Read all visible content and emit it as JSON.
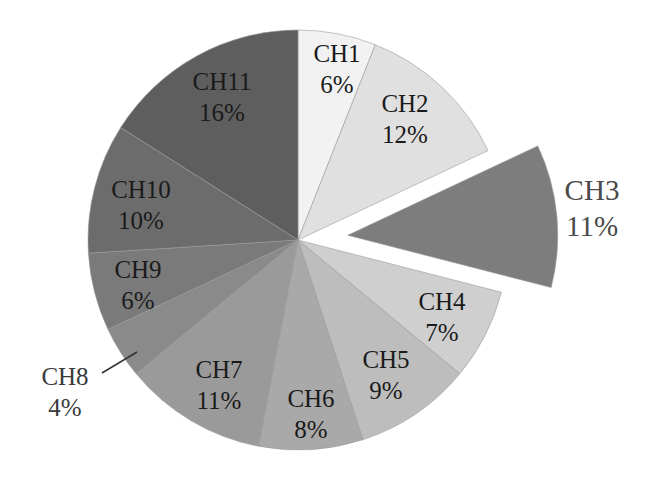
{
  "chart_data": {
    "type": "pie",
    "title": "",
    "categories": [
      "CH1",
      "CH2",
      "CH3",
      "CH4",
      "CH5",
      "CH6",
      "CH7",
      "CH8",
      "CH9",
      "CH10",
      "CH11"
    ],
    "values": [
      6,
      12,
      11,
      7,
      9,
      8,
      11,
      4,
      6,
      10,
      16
    ],
    "unit": "%",
    "labels": [
      "CH1 6%",
      "CH2 12%",
      "CH3 11%",
      "CH4 7%",
      "CH5 9%",
      "CH6 8%",
      "CH7 11%",
      "CH8 4%",
      "CH9 6%",
      "CH10 10%",
      "CH11 16%"
    ],
    "exploded": [
      "CH3"
    ],
    "start_angle": "12 o'clock",
    "direction": "clockwise",
    "legend": "none (data labels on slices)",
    "colors": [
      "#f2f2f2",
      "#e0e0e0",
      "#7d7d7d",
      "#cfcfcf",
      "#bdbdbd",
      "#a9a9a9",
      "#9a9a9a",
      "#8a8a8a",
      "#7a7a7a",
      "#6c6c6c",
      "#5e5e5e"
    ]
  },
  "slices": [
    {
      "name": "CH1",
      "pct": "6%",
      "value": 6,
      "color": "#f2f2f2",
      "label_x": 337,
      "label_y": 62,
      "explode": 0
    },
    {
      "name": "CH2",
      "pct": "12%",
      "value": 12,
      "color": "#e0e0e0",
      "label_x": 405,
      "label_y": 112,
      "explode": 0
    },
    {
      "name": "CH3",
      "pct": "11%",
      "value": 11,
      "color": "#7d7d7d",
      "label_x": 592,
      "label_y": 200,
      "explode": 50
    },
    {
      "name": "CH4",
      "pct": "7%",
      "value": 7,
      "color": "#cfcfcf",
      "label_x": 442,
      "label_y": 310,
      "explode": 0
    },
    {
      "name": "CH5",
      "pct": "9%",
      "value": 9,
      "color": "#bdbdbd",
      "label_x": 386,
      "label_y": 368,
      "explode": 0
    },
    {
      "name": "CH6",
      "pct": "8%",
      "value": 8,
      "color": "#a9a9a9",
      "label_x": 311,
      "label_y": 407,
      "explode": 0
    },
    {
      "name": "CH7",
      "pct": "11%",
      "value": 11,
      "color": "#9a9a9a",
      "label_x": 219,
      "label_y": 378,
      "explode": 0
    },
    {
      "name": "CH8",
      "pct": "4%",
      "value": 4,
      "color": "#8a8a8a",
      "label_x": 65,
      "label_y": 385,
      "explode": 0
    },
    {
      "name": "CH9",
      "pct": "6%",
      "value": 6,
      "color": "#7a7a7a",
      "label_x": 138,
      "label_y": 278,
      "explode": 0
    },
    {
      "name": "CH10",
      "pct": "10%",
      "value": 10,
      "color": "#6c6c6c",
      "label_x": 141,
      "label_y": 198,
      "explode": 0
    },
    {
      "name": "CH11",
      "pct": "16%",
      "value": 16,
      "color": "#5e5e5e",
      "label_x": 222,
      "label_y": 90,
      "explode": 0
    }
  ],
  "leader_line": {
    "name": "CH8",
    "x1": 102,
    "y1": 373,
    "x2": 137,
    "y2": 352
  }
}
